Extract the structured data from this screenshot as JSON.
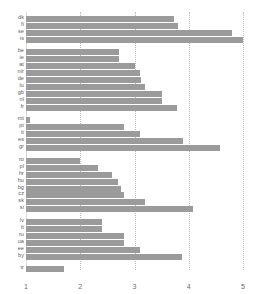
{
  "chart_data": {
    "type": "bar",
    "orientation": "horizontal",
    "title": "",
    "subtitle": "",
    "xlabel": "",
    "ylabel": "",
    "xlim": [
      1,
      5
    ],
    "ylim": null,
    "grid": true,
    "gridlines_axis": "x",
    "legend": null,
    "bar_color": "#9b9b9b",
    "xticks": [
      "1",
      "2",
      "3",
      "4",
      "5"
    ],
    "xtick_values": [
      1,
      2,
      3,
      4,
      5
    ],
    "categories": [
      "dk",
      "fi",
      "se",
      "is",
      "be",
      "ie",
      "at",
      "nir",
      "de",
      "lu",
      "gb",
      "nl",
      "fr",
      "mt",
      "pt",
      "it",
      "es",
      "gr",
      "ro",
      "pl",
      "hr",
      "hu",
      "bg",
      "cz",
      "sk",
      "si",
      "lv",
      "lt",
      "ru",
      "ua",
      "ee",
      "by",
      "tr"
    ],
    "values": [
      3.73,
      3.8,
      4.8,
      5.0,
      2.72,
      2.72,
      3.0,
      3.1,
      3.12,
      3.2,
      3.5,
      3.5,
      3.78,
      1.08,
      2.8,
      3.1,
      3.9,
      4.58,
      2.0,
      2.32,
      2.58,
      2.7,
      2.75,
      2.8,
      3.2,
      4.08,
      2.4,
      2.4,
      2.8,
      2.8,
      3.1,
      3.88,
      1.7
    ],
    "groups": [
      {
        "name": "nordic",
        "categories": [
          "dk",
          "fi",
          "se",
          "is"
        ],
        "values": [
          3.73,
          3.8,
          4.8,
          5.0
        ]
      },
      {
        "name": "western",
        "categories": [
          "be",
          "ie",
          "at",
          "nir",
          "de",
          "lu",
          "gb",
          "nl",
          "fr"
        ],
        "values": [
          2.72,
          2.72,
          3.0,
          3.1,
          3.12,
          3.2,
          3.5,
          3.5,
          3.78
        ]
      },
      {
        "name": "southern",
        "categories": [
          "mt",
          "pt",
          "it",
          "es",
          "gr"
        ],
        "values": [
          1.08,
          2.8,
          3.1,
          3.9,
          4.58
        ]
      },
      {
        "name": "central-eastern",
        "categories": [
          "ro",
          "pl",
          "hr",
          "hu",
          "bg",
          "cz",
          "sk",
          "si"
        ],
        "values": [
          2.0,
          2.32,
          2.58,
          2.7,
          2.75,
          2.8,
          3.2,
          4.08
        ]
      },
      {
        "name": "baltic-eastern",
        "categories": [
          "lv",
          "lt",
          "ru",
          "ua",
          "ee",
          "by"
        ],
        "values": [
          2.4,
          2.4,
          2.8,
          2.8,
          3.1,
          3.88
        ]
      },
      {
        "name": "other",
        "categories": [
          "tr"
        ],
        "values": [
          1.7
        ]
      }
    ]
  },
  "chart": {
    "bars": [
      {
        "label": "dk",
        "value": 3.73,
        "y": 17
      },
      {
        "label": "fi",
        "value": 3.8,
        "y": 26
      },
      {
        "label": "se",
        "value": 4.8,
        "y": 35
      },
      {
        "label": "is",
        "value": 5.0,
        "y": 44
      },
      {
        "label": "be",
        "value": 2.72,
        "y": 60
      },
      {
        "label": "ie",
        "value": 2.72,
        "y": 69
      },
      {
        "label": "at",
        "value": 3.0,
        "y": 78
      },
      {
        "label": "nir",
        "value": 3.1,
        "y": 87
      },
      {
        "label": "de",
        "value": 3.12,
        "y": 96
      },
      {
        "label": "lu",
        "value": 3.2,
        "y": 105
      },
      {
        "label": "gb",
        "value": 3.5,
        "y": 114
      },
      {
        "label": "nl",
        "value": 3.5,
        "y": 123
      },
      {
        "label": "fr",
        "value": 3.78,
        "y": 132
      },
      {
        "label": "mt",
        "value": 1.08,
        "y": 148
      },
      {
        "label": "pt",
        "value": 2.8,
        "y": 157
      },
      {
        "label": "it",
        "value": 3.1,
        "y": 166
      },
      {
        "label": "es",
        "value": 3.9,
        "y": 175
      },
      {
        "label": "gr",
        "value": 4.58,
        "y": 184
      },
      {
        "label": "ro",
        "value": 2.0,
        "y": 200
      },
      {
        "label": "pl",
        "value": 2.32,
        "y": 209
      },
      {
        "label": "hr",
        "value": 2.58,
        "y": 218
      },
      {
        "label": "hu",
        "value": 2.7,
        "y": 227
      },
      {
        "label": "bg",
        "value": 2.75,
        "y": 236
      },
      {
        "label": "cz",
        "value": 2.8,
        "y": 245
      },
      {
        "label": "sk",
        "value": 3.2,
        "y": 254
      },
      {
        "label": "si",
        "value": 4.08,
        "y": 263
      },
      {
        "label": "lv",
        "value": 2.4,
        "y": 279
      },
      {
        "label": "lt",
        "value": 2.4,
        "y": 288
      },
      {
        "label": "ru",
        "value": 2.8,
        "y": 297
      },
      {
        "label": "ua",
        "value": 2.8,
        "y": 306
      },
      {
        "label": "ee",
        "value": 3.1,
        "y": 315
      },
      {
        "label": "by",
        "value": 3.88,
        "y": 324
      },
      {
        "label": "tr",
        "value": 1.7,
        "y": 340
      }
    ]
  }
}
